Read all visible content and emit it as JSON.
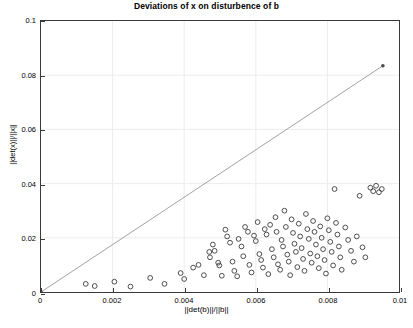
{
  "chart_data": {
    "type": "scatter",
    "title": "Deviations of x on disturbence of b",
    "xlabel": "||det(b)||/||b||",
    "ylabel": "||det(x)||/||x||",
    "xlim": [
      0,
      0.01
    ],
    "ylim": [
      0,
      0.1
    ],
    "xticks": [
      0,
      0.002,
      0.004,
      0.006,
      0.008,
      0.01
    ],
    "xticklabels": [
      "0",
      "0.002",
      "0.004",
      "0.006",
      "0.008",
      "0.01"
    ],
    "yticks": [
      0,
      0.02,
      0.04,
      0.06,
      0.08,
      0.1
    ],
    "yticklabels": [
      "0",
      "0.02",
      "0.04",
      "0.06",
      "0.08",
      "0.1"
    ],
    "grid": true,
    "legend": null,
    "marker_style": "open-circle",
    "marker_color": "#3a3a3a",
    "series": [
      {
        "name": "reference-line",
        "type": "line",
        "color": "#8a8a8a",
        "x": [
          0,
          0.00955
        ],
        "y": [
          0,
          0.0835
        ],
        "endpoint_markers": true
      },
      {
        "name": "deviation-samples",
        "type": "scatter",
        "points": [
          [
            0.00125,
            0.003
          ],
          [
            0.0015,
            0.0022
          ],
          [
            0.00205,
            0.0038
          ],
          [
            0.0025,
            0.002
          ],
          [
            0.00305,
            0.0052
          ],
          [
            0.00345,
            0.003
          ],
          [
            0.0039,
            0.007
          ],
          [
            0.004,
            0.0048
          ],
          [
            0.00425,
            0.009
          ],
          [
            0.0044,
            0.01
          ],
          [
            0.00455,
            0.0062
          ],
          [
            0.0047,
            0.0148
          ],
          [
            0.00472,
            0.0128
          ],
          [
            0.0048,
            0.0175
          ],
          [
            0.00485,
            0.0152
          ],
          [
            0.00495,
            0.0108
          ],
          [
            0.00498,
            0.0098
          ],
          [
            0.00505,
            0.006
          ],
          [
            0.00515,
            0.023
          ],
          [
            0.0052,
            0.0205
          ],
          [
            0.00528,
            0.0182
          ],
          [
            0.00535,
            0.0112
          ],
          [
            0.0054,
            0.0078
          ],
          [
            0.00548,
            0.0058
          ],
          [
            0.00552,
            0.0196
          ],
          [
            0.0056,
            0.0168
          ],
          [
            0.00565,
            0.0132
          ],
          [
            0.0057,
            0.024
          ],
          [
            0.00578,
            0.0222
          ],
          [
            0.00582,
            0.01
          ],
          [
            0.00588,
            0.0072
          ],
          [
            0.00595,
            0.0208
          ],
          [
            0.006,
            0.0188
          ],
          [
            0.00605,
            0.0258
          ],
          [
            0.0061,
            0.014
          ],
          [
            0.00615,
            0.0118
          ],
          [
            0.0062,
            0.009
          ],
          [
            0.00625,
            0.0232
          ],
          [
            0.0063,
            0.0212
          ],
          [
            0.00635,
            0.0066
          ],
          [
            0.0064,
            0.0248
          ],
          [
            0.00645,
            0.0158
          ],
          [
            0.0065,
            0.0128
          ],
          [
            0.00655,
            0.0276
          ],
          [
            0.00658,
            0.0222
          ],
          [
            0.00662,
            0.0102
          ],
          [
            0.00668,
            0.0082
          ],
          [
            0.00672,
            0.0192
          ],
          [
            0.00676,
            0.0168
          ],
          [
            0.0068,
            0.03
          ],
          [
            0.00684,
            0.024
          ],
          [
            0.00688,
            0.0138
          ],
          [
            0.00692,
            0.0112
          ],
          [
            0.00696,
            0.0062
          ],
          [
            0.007,
            0.0268
          ],
          [
            0.00704,
            0.0218
          ],
          [
            0.00708,
            0.0178
          ],
          [
            0.00712,
            0.0148
          ],
          [
            0.00716,
            0.0092
          ],
          [
            0.0072,
            0.0252
          ],
          [
            0.00724,
            0.0205
          ],
          [
            0.00728,
            0.0162
          ],
          [
            0.00732,
            0.0122
          ],
          [
            0.00736,
            0.0078
          ],
          [
            0.0074,
            0.0288
          ],
          [
            0.00744,
            0.0232
          ],
          [
            0.00748,
            0.0196
          ],
          [
            0.00752,
            0.0142
          ],
          [
            0.00756,
            0.0108
          ],
          [
            0.0076,
            0.0262
          ],
          [
            0.00764,
            0.0222
          ],
          [
            0.00768,
            0.0175
          ],
          [
            0.00772,
            0.0132
          ],
          [
            0.00776,
            0.0088
          ],
          [
            0.0078,
            0.0242
          ],
          [
            0.00784,
            0.02
          ],
          [
            0.00788,
            0.0158
          ],
          [
            0.00792,
            0.0118
          ],
          [
            0.00796,
            0.0068
          ],
          [
            0.008,
            0.0272
          ],
          [
            0.00804,
            0.0228
          ],
          [
            0.00808,
            0.0185
          ],
          [
            0.00812,
            0.0148
          ],
          [
            0.00816,
            0.0098
          ],
          [
            0.0082,
            0.038
          ],
          [
            0.00824,
            0.0255
          ],
          [
            0.00828,
            0.0212
          ],
          [
            0.00832,
            0.0168
          ],
          [
            0.00836,
            0.0128
          ],
          [
            0.0084,
            0.0082
          ],
          [
            0.0085,
            0.0238
          ],
          [
            0.00858,
            0.0192
          ],
          [
            0.00866,
            0.0152
          ],
          [
            0.00874,
            0.0112
          ],
          [
            0.00882,
            0.0205
          ],
          [
            0.0089,
            0.0355
          ],
          [
            0.00898,
            0.0165
          ],
          [
            0.00906,
            0.0128
          ],
          [
            0.0092,
            0.0385
          ],
          [
            0.00928,
            0.0372
          ],
          [
            0.00936,
            0.0392
          ],
          [
            0.00944,
            0.0368
          ],
          [
            0.00952,
            0.038
          ]
        ]
      }
    ]
  },
  "footer": {
    "caption": ""
  }
}
